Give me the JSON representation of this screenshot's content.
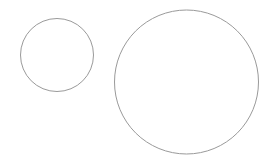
{
  "canvas": {
    "width": 274,
    "height": 164,
    "background": "#ffffff"
  },
  "shapes": [
    {
      "type": "circle",
      "name": "small-circle",
      "cx": 57,
      "cy": 55,
      "r": 36.5,
      "stroke": "#9a9a9a",
      "stroke_width": 1,
      "fill": "none"
    },
    {
      "type": "circle",
      "name": "large-circle",
      "cx": 186.5,
      "cy": 82,
      "r": 72,
      "stroke": "#9a9a9a",
      "stroke_width": 1,
      "fill": "none"
    }
  ]
}
